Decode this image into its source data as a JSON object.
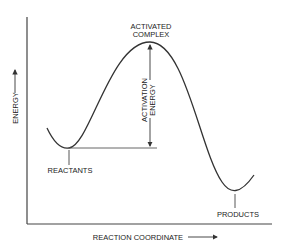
{
  "diagram": {
    "labels": {
      "activated_complex_line1": "ACTIVATED",
      "activated_complex_line2": "COMPLEX",
      "activation_energy_line1": "ACTIVATION",
      "activation_energy_line2": "ENERGY",
      "reactants": "REACTANTS",
      "products": "PRODUCTS",
      "x_axis": "REACTION COORDINATE",
      "y_axis": "ENERGY"
    },
    "colors": {
      "line": "#333333",
      "background": "#ffffff"
    }
  }
}
